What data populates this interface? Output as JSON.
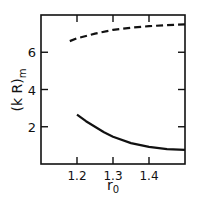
{
  "chart_data": {
    "type": "line",
    "title": "",
    "xlabel": "r₀",
    "ylabel": "(k R)m",
    "ylabel_main": "(k R)",
    "ylabel_sub": "m",
    "xlim": [
      1.1,
      1.5
    ],
    "ylim": [
      0,
      8
    ],
    "xticks": [
      1.2,
      1.3,
      1.4
    ],
    "xtick_labels": [
      "1.2",
      "1.3",
      "1.4"
    ],
    "yticks": [
      2,
      4,
      6
    ],
    "ytick_labels": [
      "2",
      "4",
      "6"
    ],
    "grid": false,
    "legend": "none",
    "series": [
      {
        "name": "dashed",
        "style": "dashed",
        "color": "#111111",
        "x": [
          1.18,
          1.2,
          1.25,
          1.3,
          1.35,
          1.4,
          1.45,
          1.5
        ],
        "y": [
          6.6,
          6.75,
          7.0,
          7.2,
          7.32,
          7.4,
          7.46,
          7.5
        ]
      },
      {
        "name": "solid",
        "style": "solid",
        "color": "#111111",
        "x": [
          1.2,
          1.225,
          1.25,
          1.275,
          1.3,
          1.35,
          1.4,
          1.45,
          1.5
        ],
        "y": [
          2.65,
          2.3,
          2.0,
          1.7,
          1.46,
          1.12,
          0.92,
          0.8,
          0.76
        ]
      }
    ]
  }
}
